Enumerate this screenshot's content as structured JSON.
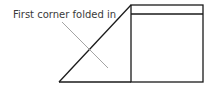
{
  "diagram": {
    "label": "First corner folded in",
    "colors": {
      "stroke": "#1a1a1a",
      "leader": "#9a9a9a",
      "text": "#3a3a3a"
    }
  }
}
